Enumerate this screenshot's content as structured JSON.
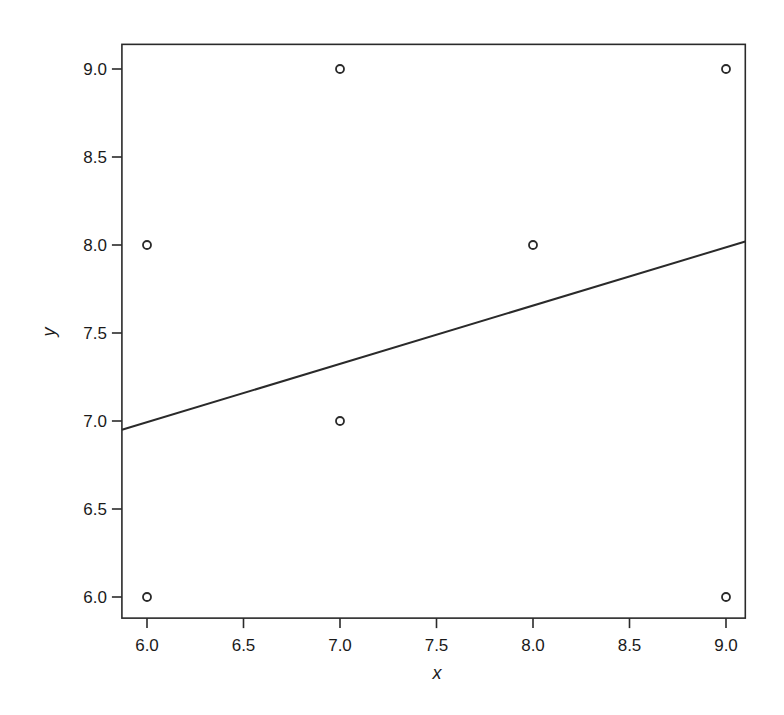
{
  "chart_data": {
    "type": "scatter",
    "title": "",
    "xlabel": "x",
    "ylabel": "y",
    "xlim": [
      5.87,
      9.1
    ],
    "ylim": [
      5.88,
      9.14
    ],
    "grid": false,
    "legend": null,
    "x_ticks": [
      "6.0",
      "6.5",
      "7.0",
      "7.5",
      "8.0",
      "8.5",
      "9.0"
    ],
    "y_ticks": [
      "6.0",
      "6.5",
      "7.0",
      "7.5",
      "8.0",
      "8.5",
      "9.0"
    ],
    "series": [
      {
        "name": "points",
        "marker": "open-circle",
        "points": [
          {
            "x": 6,
            "y": 8
          },
          {
            "x": 6,
            "y": 6
          },
          {
            "x": 7,
            "y": 9
          },
          {
            "x": 7,
            "y": 7
          },
          {
            "x": 8,
            "y": 8
          },
          {
            "x": 9,
            "y": 9
          },
          {
            "x": 9,
            "y": 6
          }
        ]
      },
      {
        "name": "fitted line",
        "type": "line",
        "points": [
          {
            "x": 5.87,
            "y": 6.95
          },
          {
            "x": 9.1,
            "y": 8.02
          }
        ]
      }
    ]
  }
}
